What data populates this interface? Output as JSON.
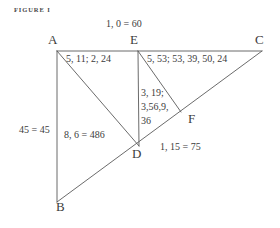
{
  "figure": {
    "caption": "FIGURE I",
    "background_color": "#ffffff",
    "line_color": "#5a5a5a",
    "text_color": "#3c3c3c"
  },
  "vertices": {
    "a": "A",
    "b": "B",
    "c": "C",
    "d": "D",
    "e": "E",
    "f": "F"
  },
  "annotations": {
    "top_center": "1, 0 = 60",
    "upper_left": "5, 11; 2, 24",
    "upper_right": "5, 53; 53, 39, 50, 24",
    "center_line1": "3, 19;",
    "center_line2": "3,56,9,",
    "center_line3": "36",
    "left_side": "45 = 45",
    "mid_left": "8, 6 = 486",
    "lower_right": "1, 15 = 75"
  },
  "segments": [
    {
      "name": "ac-horizontal",
      "from": "A",
      "to": "C"
    },
    {
      "name": "ab-vertical",
      "from": "A",
      "to": "B"
    },
    {
      "name": "ed-vertical",
      "from": "E",
      "to": "D"
    },
    {
      "name": "ad-diagonal",
      "from": "A",
      "to": "D"
    },
    {
      "name": "bc-diagonal",
      "from": "B",
      "to": "C"
    },
    {
      "name": "ef-diagonal",
      "from": "E",
      "to": "F"
    }
  ]
}
